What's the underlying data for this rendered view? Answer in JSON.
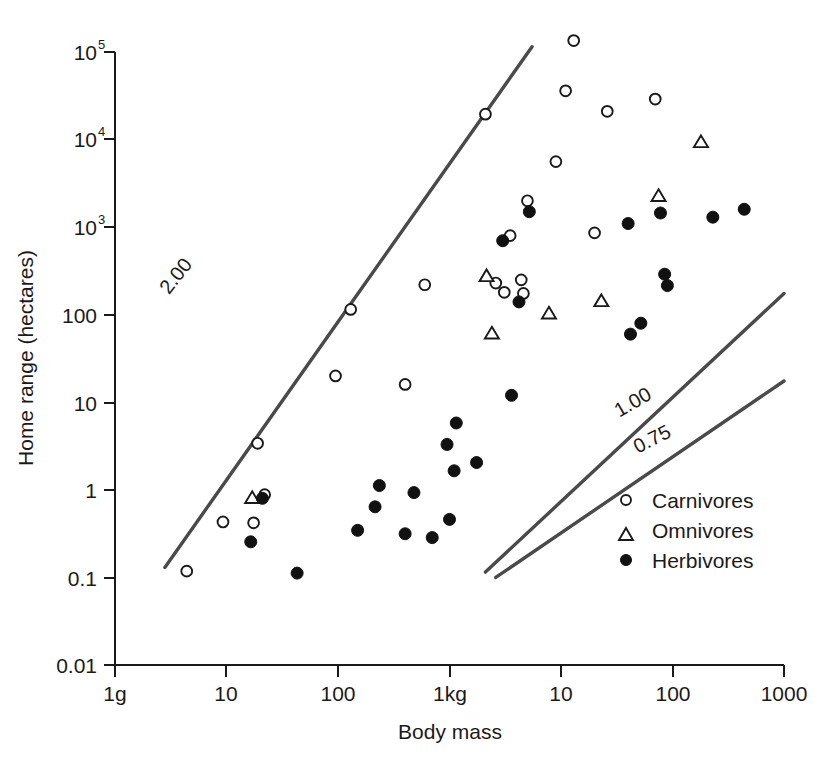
{
  "chart_data": {
    "type": "scatter",
    "title": "",
    "xlabel": "Body mass",
    "ylabel": "Home range (hectares)",
    "xscale": "log",
    "yscale": "log",
    "grid": false,
    "xlim": [
      1,
      1000000
    ],
    "ylim": [
      0.01,
      100000
    ],
    "xtick_labels": [
      "1g",
      "10",
      "100",
      "1kg",
      "10",
      "100",
      "1000"
    ],
    "xtick_values": [
      1,
      10,
      100,
      1000,
      10000,
      100000,
      1000000
    ],
    "ytick_labels": [
      "0.01",
      "0.1",
      "1",
      "10",
      "100",
      "10³",
      "10⁴",
      "10⁵"
    ],
    "ytick_values": [
      0.01,
      0.1,
      1,
      10,
      100,
      1000,
      10000,
      100000
    ],
    "ytick_sup": [
      "",
      "",
      "",
      "",
      "",
      "3",
      "4",
      "5"
    ],
    "legend_position": "bottom-right",
    "legend": [
      {
        "name": "Carnivores",
        "marker": "open-circle"
      },
      {
        "name": "Omnivores",
        "marker": "open-triangle"
      },
      {
        "name": "Herbivores",
        "marker": "filled-circle"
      }
    ],
    "annotations": [
      {
        "label": "2.00",
        "slope": 2.0,
        "rotation": -52
      },
      {
        "label": "1.00",
        "slope": 1.0,
        "rotation": -30
      },
      {
        "label": "0.75",
        "slope": 0.75,
        "rotation": -27
      }
    ],
    "reference_lines": [
      {
        "label": "2.00",
        "x1": 2.8,
        "y1": 0.13,
        "x2": 5500,
        "y2": 115000
      },
      {
        "label": "1.00",
        "x1": 2100,
        "y1": 0.115,
        "x2": 1000000,
        "y2": 175
      },
      {
        "label": "0.75",
        "x1": 2600,
        "y1": 0.1,
        "x2": 1000000,
        "y2": 17.5
      }
    ],
    "series": [
      {
        "name": "Carnivores",
        "marker": "open-circle",
        "points": [
          [
            4.4,
            0.118
          ],
          [
            9.3,
            0.43
          ],
          [
            17.5,
            0.42
          ],
          [
            22.0,
            0.88
          ],
          [
            19.0,
            3.4
          ],
          [
            95.0,
            20.0
          ],
          [
            130.0,
            115.0
          ],
          [
            400.0,
            16.0
          ],
          [
            600.0,
            220.0
          ],
          [
            2100.0,
            19500.0
          ],
          [
            2600.0,
            230.0
          ],
          [
            3100.0,
            180.0
          ],
          [
            3500.0,
            800.0
          ],
          [
            4400.0,
            250.0
          ],
          [
            4600.0,
            175.0
          ],
          [
            5000.0,
            2000.0
          ],
          [
            9000.0,
            5600.0
          ],
          [
            11000.0,
            36000.0
          ],
          [
            13000.0,
            135000.0
          ],
          [
            20000.0,
            860.0
          ],
          [
            26000.0,
            21000.0
          ],
          [
            70000.0,
            29000.0
          ]
        ]
      },
      {
        "name": "Omnivores",
        "marker": "open-triangle",
        "points": [
          [
            17.0,
            0.82
          ],
          [
            2150.0,
            280.0
          ],
          [
            2400.0,
            62.0
          ],
          [
            7800.0,
            105.0
          ],
          [
            23000.0,
            145.0
          ],
          [
            75000.0,
            2300.0
          ],
          [
            180000.0,
            9500.0
          ]
        ]
      },
      {
        "name": "Herbivores",
        "marker": "filled-circle",
        "points": [
          [
            16.5,
            0.255
          ],
          [
            21.0,
            0.8
          ],
          [
            43.0,
            0.112
          ],
          [
            150.0,
            0.345
          ],
          [
            215.0,
            0.64
          ],
          [
            235.0,
            1.12
          ],
          [
            400.0,
            0.315
          ],
          [
            480.0,
            0.93
          ],
          [
            700.0,
            0.285
          ],
          [
            950.0,
            3.3
          ],
          [
            1000.0,
            0.46
          ],
          [
            1100.0,
            1.65
          ],
          [
            1150.0,
            5.8
          ],
          [
            1750.0,
            2.05
          ],
          [
            3000.0,
            700.0
          ],
          [
            3600.0,
            12.0
          ],
          [
            4200.0,
            140.0
          ],
          [
            5200.0,
            1500.0
          ],
          [
            40000.0,
            1100.0
          ],
          [
            42000.0,
            60.0
          ],
          [
            52000.0,
            80.0
          ],
          [
            78000.0,
            1450.0
          ],
          [
            85000.0,
            290.0
          ],
          [
            90000.0,
            215.0
          ],
          [
            230000.0,
            1300.0
          ],
          [
            440000.0,
            1600.0
          ]
        ]
      }
    ]
  },
  "legend": {
    "carnivores": "Carnivores",
    "omnivores": "Omnivores",
    "herbivores": "Herbivores"
  },
  "axes": {
    "x_title": "Body mass",
    "y_title": "Home range (hectares)"
  },
  "slope_labels": {
    "two": "2.00",
    "one": "1.00",
    "threequarter": "0.75"
  },
  "colors": {
    "ink": "#1a1a1a",
    "line": "#4a4a4a",
    "background": "#ffffff"
  }
}
